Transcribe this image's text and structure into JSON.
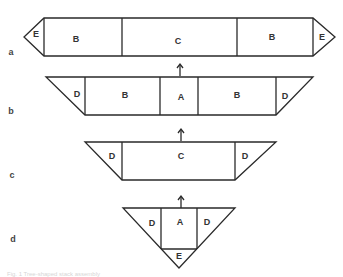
{
  "diagram": {
    "rows": [
      {
        "id": "a",
        "label": "a",
        "cells": [
          "E",
          "B",
          "C",
          "B",
          "E"
        ]
      },
      {
        "id": "b",
        "label": "b",
        "cells": [
          "D",
          "B",
          "A",
          "B",
          "D"
        ]
      },
      {
        "id": "c",
        "label": "c",
        "cells": [
          "D",
          "C",
          "D"
        ]
      },
      {
        "id": "d",
        "label": "d",
        "cells": [
          "D",
          "A",
          "D",
          "E"
        ]
      }
    ],
    "arrows": [
      "b-to-a",
      "c-to-b",
      "d-to-c"
    ],
    "caption": "Fig. 1 Tree-shaped stack assembly"
  }
}
